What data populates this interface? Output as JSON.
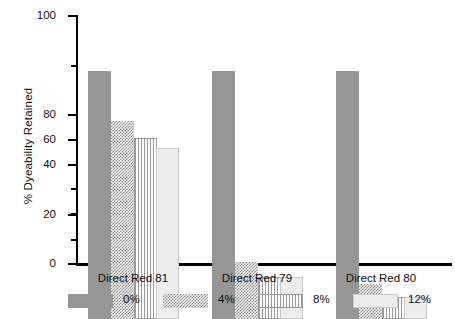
{
  "chart_data": {
    "type": "bar",
    "title": "",
    "xlabel": "",
    "ylabel": "% Dyeability Retained",
    "ylim": [
      0,
      100
    ],
    "ytick_labels": [
      "0",
      "20",
      "40",
      "60",
      "80",
      "100"
    ],
    "ytick_values": [
      0,
      20,
      40,
      60,
      80,
      100
    ],
    "yminor_values": [
      10,
      30,
      50,
      70,
      90
    ],
    "grid": false,
    "legend_position": "bottom",
    "categories": [
      "Direct Red 81",
      "Direct Red 79",
      "Direct Red 80"
    ],
    "series": [
      {
        "name": "0%",
        "pattern": "solid",
        "values": [
          100,
          100,
          100
        ]
      },
      {
        "name": "4%",
        "pattern": "check",
        "values": [
          80,
          23,
          14
        ]
      },
      {
        "name": "8%",
        "pattern": "vlines",
        "values": [
          73,
          17,
          9
        ]
      },
      {
        "name": "12%",
        "pattern": "light",
        "values": [
          69,
          17,
          9
        ]
      }
    ]
  },
  "colors": {
    "series_0": "#969696",
    "series_4": "#8f8f8f",
    "series_8": "#9a9a9a",
    "series_12": "#ededed",
    "axis": "#000000",
    "text": "#111111",
    "background": "#ffffff"
  }
}
